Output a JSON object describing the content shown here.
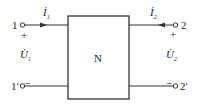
{
  "diagram": {
    "network_label": "N",
    "ports": {
      "left": {
        "terminal_top": "1",
        "terminal_bottom": "1′",
        "current": "İ",
        "current_sub": "1",
        "voltage": "U̇",
        "voltage_sub": "1",
        "plus": "+",
        "minus": "−"
      },
      "right": {
        "terminal_top": "2",
        "terminal_bottom": "2′",
        "current": "İ",
        "current_sub": "2",
        "voltage": "U̇",
        "voltage_sub": "2",
        "plus": "+",
        "minus": "−"
      }
    },
    "colors": {
      "line": "#333333",
      "background": "#ffffff"
    }
  }
}
